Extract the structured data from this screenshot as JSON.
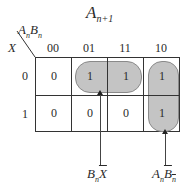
{
  "title": {
    "base": "A",
    "sub": "n+1"
  },
  "corner": {
    "col_var": [
      {
        "base": "A",
        "sub": "n"
      },
      {
        "base": "B",
        "sub": "n"
      }
    ],
    "row_var": "X"
  },
  "columns": [
    "00",
    "01",
    "11",
    "10"
  ],
  "rows": [
    "0",
    "1"
  ],
  "cells": [
    [
      "0",
      "1",
      "1",
      "1"
    ],
    [
      "0",
      "0",
      "0",
      "1"
    ]
  ],
  "groups": [
    {
      "name": "horizontal-group",
      "cells": "row0 cols 01,11",
      "label": {
        "t1": "B",
        "t1sub": "n",
        "t2": "X",
        "t2_overline": true
      }
    },
    {
      "name": "vertical-group",
      "cells": "col 10 rows 0,1",
      "label": {
        "t1": "A",
        "t1sub": "n",
        "t2": "B",
        "t2sub": "n",
        "t2_overline": true
      }
    }
  ],
  "colors": {
    "group_fill": "#c4c4c4",
    "group_border": "#8a8a8a",
    "line": "#333333"
  }
}
